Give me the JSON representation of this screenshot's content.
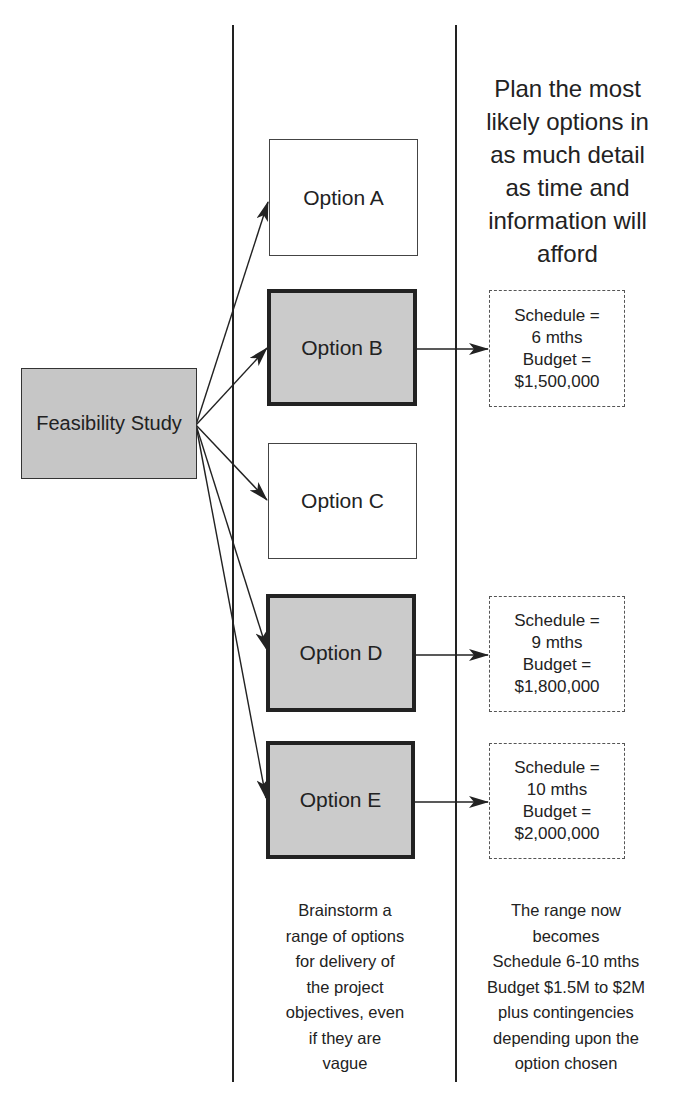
{
  "diagram": {
    "type": "flow",
    "source": {
      "label": "Feasibility Study"
    },
    "options": [
      {
        "id": "A",
        "label": "Option A",
        "likely": false
      },
      {
        "id": "B",
        "label": "Option B",
        "likely": true
      },
      {
        "id": "C",
        "label": "Option C",
        "likely": false
      },
      {
        "id": "D",
        "label": "Option D",
        "likely": true
      },
      {
        "id": "E",
        "label": "Option E",
        "likely": true
      }
    ],
    "plans": [
      {
        "option": "B",
        "schedule_label": "Schedule =",
        "schedule_value": "6 mths",
        "budget_label": "Budget =",
        "budget_value": "$1,500,000"
      },
      {
        "option": "D",
        "schedule_label": "Schedule =",
        "schedule_value": "9 mths",
        "budget_label": "Budget =",
        "budget_value": "$1,800,000"
      },
      {
        "option": "E",
        "schedule_label": "Schedule =",
        "schedule_value": "10 mths",
        "budget_label": "Budget =",
        "budget_value": "$2,000,000"
      }
    ],
    "column_heading_right": [
      "Plan the most",
      "likely options in",
      "as much detail",
      "as time and",
      "information will",
      "afford"
    ],
    "note_middle": [
      "Brainstorm a",
      "range of options",
      "for delivery of",
      "the project",
      "objectives, even",
      "if they are",
      "vague"
    ],
    "note_right": [
      "The range now",
      "becomes",
      "Schedule 6-10 mths",
      "Budget $1.5M to $2M",
      "plus contingencies",
      "depending upon the",
      "option chosen"
    ],
    "colors": {
      "line": "#222222",
      "highlight_fill": "#cbcbcb",
      "source_fill": "#c6c6c6",
      "plain_fill": "#ffffff"
    }
  }
}
